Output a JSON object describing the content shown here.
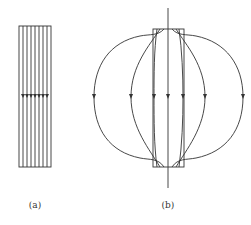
{
  "figure": {
    "panels": [
      {
        "id": "a",
        "label": "(a)",
        "description": "uniform parallel field lines through rectangular slab, arrows pointing down"
      },
      {
        "id": "b",
        "label": "(b)",
        "description": "field lines concentrated through slab and closing outside in loops, arrows pointing down"
      }
    ],
    "colors": {
      "stroke": "#333333",
      "background": "#ffffff"
    }
  }
}
